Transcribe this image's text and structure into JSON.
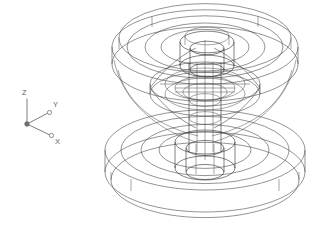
{
  "canvas": {
    "width": 329,
    "height": 236,
    "background": "#ffffff"
  },
  "drawing": {
    "title": "3D wireframe isometric view",
    "style": "wireframe",
    "line_color": "#3a3a3a",
    "model_name": "pulley-sheave-assembly"
  },
  "ucs_icon": {
    "name": "ucs-axis-triad",
    "origin_label": "",
    "axes": [
      {
        "id": "z",
        "label": "Z",
        "direction": "up"
      },
      {
        "id": "y",
        "label": "Y",
        "direction": "upper-right"
      },
      {
        "id": "x",
        "label": "X",
        "direction": "lower-right"
      }
    ],
    "color": "#6e6e6e"
  },
  "geometry": {
    "projection": "isometric",
    "ellipse_ratio": 0.4,
    "center_x": 205,
    "parts": [
      {
        "name": "upper-flange-disc",
        "type": "disc",
        "center": [
          205,
          52
        ],
        "outer_radius": 93,
        "thickness": 17,
        "rings": [
          93,
          78,
          60,
          44
        ]
      },
      {
        "name": "upper-hub-cylinder",
        "type": "cylinder",
        "center": [
          208,
          60
        ],
        "radius": 27,
        "height": 24
      },
      {
        "name": "upper-bore-cylinder",
        "type": "cylinder",
        "center": [
          208,
          58
        ],
        "radius": 17,
        "height": 22
      },
      {
        "name": "central-shaft",
        "type": "cylinder",
        "center": [
          205,
          110
        ],
        "radius": 16,
        "height": 82
      },
      {
        "name": "middle-collar",
        "type": "disc",
        "center": [
          205,
          90
        ],
        "outer_radius": 55,
        "thickness": 10,
        "rings": [
          55,
          40
        ]
      },
      {
        "name": "lower-flange-disc",
        "type": "disc",
        "center": [
          205,
          150
        ],
        "outer_radius": 100,
        "thickness": 22,
        "rings": [
          100,
          84,
          64,
          46
        ]
      },
      {
        "name": "lower-hub-cylinder",
        "type": "cylinder",
        "center": [
          205,
          150
        ],
        "radius": 30,
        "height": 26
      },
      {
        "name": "lower-bore-cylinder",
        "type": "cylinder",
        "center": [
          205,
          152
        ],
        "radius": 19,
        "height": 24
      }
    ]
  }
}
